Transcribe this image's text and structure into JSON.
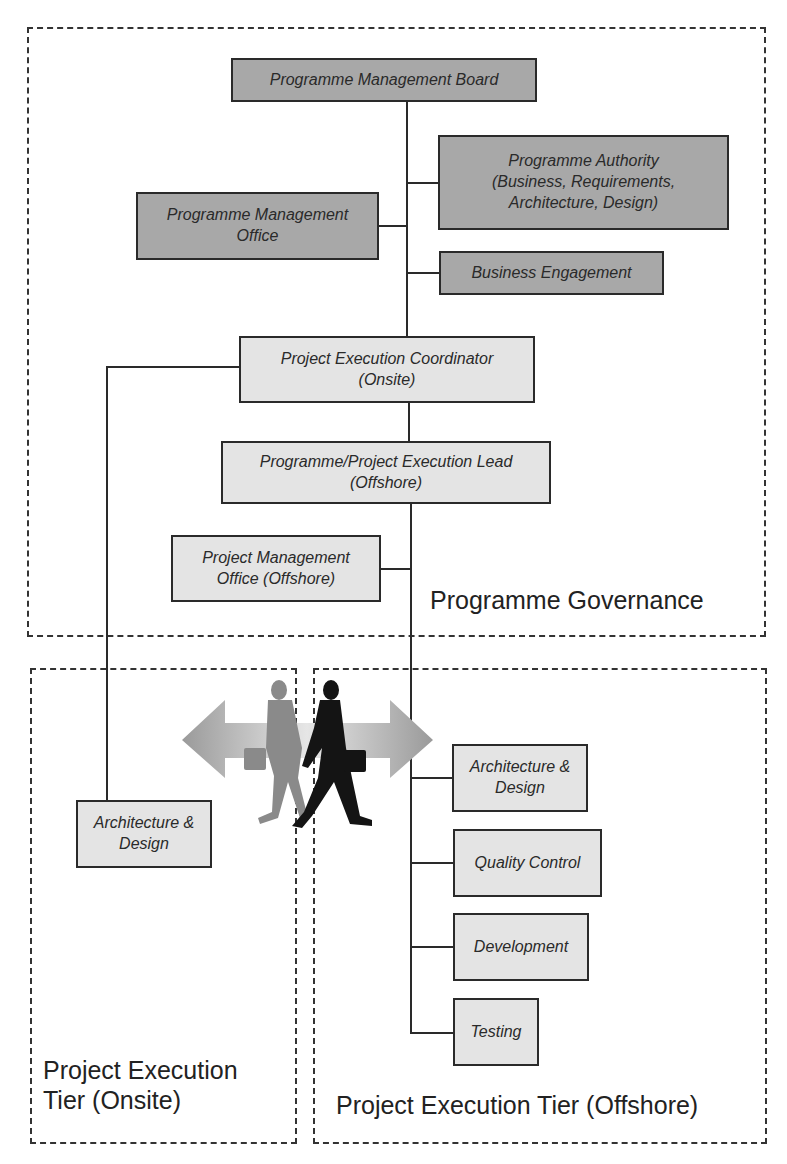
{
  "regions": {
    "governance": {
      "label": "Programme Governance"
    },
    "onsite": {
      "label": "Project Execution\nTier (Onsite)"
    },
    "offshore": {
      "label": "Project Execution Tier (Offshore)"
    }
  },
  "boxes": {
    "board": "Programme Management Board",
    "authority": "Programme Authority\n(Business, Requirements,\nArchitecture, Design)",
    "pmo": "Programme Management\nOffice",
    "engagement": "Business Engagement",
    "coordinator": "Project Execution Coordinator\n(Onsite)",
    "lead": "Programme/Project Execution Lead\n(Offshore)",
    "project_pmo": "Project Management\nOffice (Offshore)",
    "onsite_arch": "Architecture &\nDesign",
    "offshore_arch": "Architecture &\nDesign",
    "quality": "Quality Control",
    "development": "Development",
    "testing": "Testing"
  },
  "colors": {
    "governance_box": "#a8a8a8",
    "execution_box": "#e4e4e4",
    "line": "#2a2a2a"
  },
  "illustration": {
    "icon": "two-businessmen-walking-with-bidirectional-arrow"
  }
}
